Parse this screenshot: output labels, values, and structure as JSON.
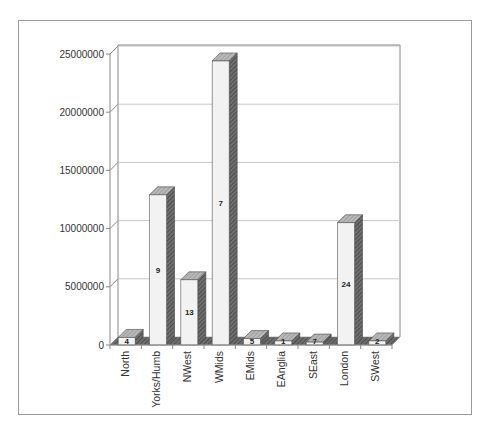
{
  "chart_data": {
    "type": "bar",
    "style": "3d-column",
    "title": "",
    "xlabel": "",
    "ylabel": "",
    "ylim": [
      0,
      25000000
    ],
    "yticks": [
      0,
      5000000,
      10000000,
      15000000,
      20000000,
      25000000
    ],
    "ytick_labels": [
      "0",
      "5000000",
      "10000000",
      "15000000",
      "20000000",
      "25000000"
    ],
    "grid": true,
    "legend": null,
    "categories": [
      "North",
      "Yorks/Humb",
      "NWest",
      "WMids",
      "EMids",
      "EAnglia",
      "SEast",
      "London",
      "SWest"
    ],
    "values": [
      650000,
      12900000,
      5600000,
      24400000,
      550000,
      350000,
      250000,
      10500000,
      350000
    ],
    "bar_labels": [
      "4",
      "9",
      "13",
      "7",
      "5",
      "1",
      "7",
      "24",
      "2"
    ],
    "colors": {
      "front": "#f2f2f2",
      "top": "#b8b8b8",
      "side": "#6e6e6e",
      "grid": "#c8c8c8",
      "axis": "#888888"
    }
  }
}
